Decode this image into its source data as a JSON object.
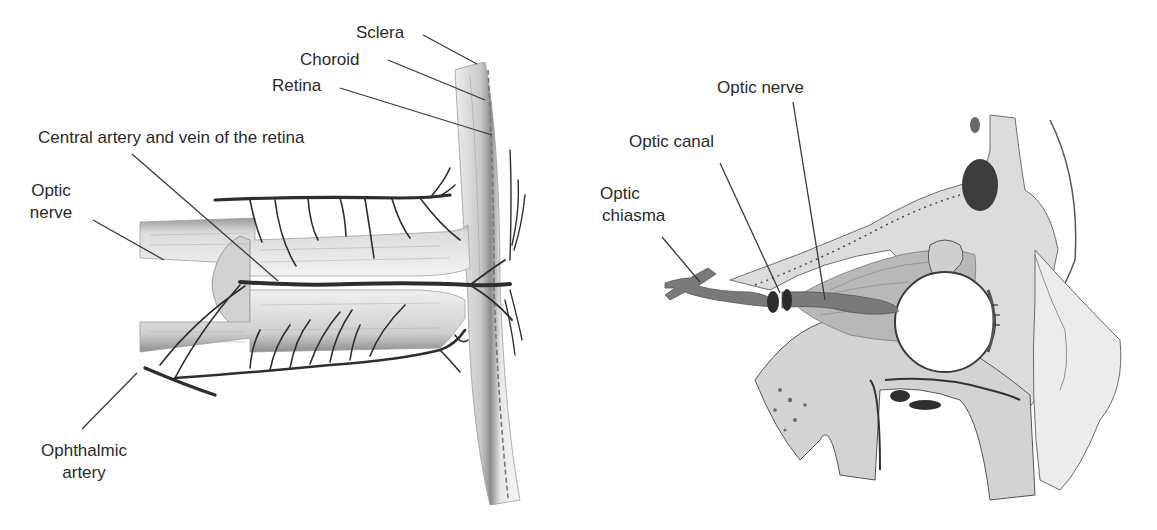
{
  "figure": {
    "panels": [
      {
        "id": "left",
        "description": "Longitudinal section of optic nerve entering eyeball wall",
        "labels": {
          "sclera": "Sclera",
          "choroid": "Choroid",
          "retina": "Retina",
          "central_vessels": "Central artery and vein of the retina",
          "optic_nerve_line1": "Optic",
          "optic_nerve_line2": "nerve",
          "ophthalmic_line1": "Ophthalmic",
          "ophthalmic_line2": "artery"
        }
      },
      {
        "id": "right",
        "description": "Lateral view of the orbit with optic nerve passing through optic canal",
        "labels": {
          "optic_nerve": "Optic nerve",
          "optic_canal": "Optic canal",
          "chiasma_line1": "Optic",
          "chiasma_line2": "chiasma"
        }
      }
    ],
    "colors": {
      "ink": "#2a2a2a",
      "nerve_fill": "#7a7a7a",
      "tissue_light": "#e6e6e6",
      "tissue_mid": "#bdbdbd",
      "background": "#ffffff"
    }
  }
}
